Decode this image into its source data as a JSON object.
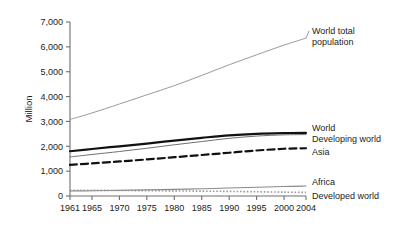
{
  "chart_data": {
    "type": "line",
    "title": "",
    "subtitle": "",
    "xlabel": "",
    "ylabel": "Million",
    "xlim": [
      1961,
      2004
    ],
    "ylim": [
      0,
      7000
    ],
    "grid": false,
    "legend_position": "right-inline-labels",
    "x_tick_labels": [
      "1961",
      "1965",
      "1970",
      "1975",
      "1980",
      "1985",
      "1990",
      "1995",
      "2000",
      "2004"
    ],
    "x_ticks": [
      1961,
      1965,
      1970,
      1975,
      1980,
      1985,
      1990,
      1995,
      2000,
      2004
    ],
    "y_tick_labels": [
      "0",
      "1,000",
      "2,000",
      "3,000",
      "4,000",
      "5,000",
      "6,000",
      "7,000"
    ],
    "y_ticks": [
      0,
      1000,
      2000,
      3000,
      4000,
      5000,
      6000,
      7000
    ],
    "x": [
      1961,
      1965,
      1970,
      1975,
      1980,
      1985,
      1990,
      1995,
      2000,
      2004
    ],
    "series": [
      {
        "name": "World total population",
        "label": "World total population",
        "label_lines": [
          "World total",
          "population"
        ],
        "style": "solid-thin",
        "color": "#9a9a9a",
        "width": 1.0,
        "values": [
          3080,
          3340,
          3700,
          4070,
          4440,
          4850,
          5280,
          5680,
          6070,
          6350
        ]
      },
      {
        "name": "World",
        "label": "World",
        "label_lines": [
          "World"
        ],
        "style": "solid-thick",
        "color": "#111111",
        "width": 2.2,
        "values": [
          1800,
          1890,
          2000,
          2110,
          2230,
          2340,
          2440,
          2500,
          2530,
          2540
        ]
      },
      {
        "name": "Developing world",
        "label": "Developing world",
        "label_lines": [
          "Developing world"
        ],
        "style": "solid-thin",
        "color": "#707070",
        "width": 1.0,
        "values": [
          1570,
          1670,
          1790,
          1920,
          2060,
          2190,
          2320,
          2410,
          2460,
          2470
        ]
      },
      {
        "name": "Asia",
        "label": "Asia",
        "label_lines": [
          "Asia"
        ],
        "style": "dashed",
        "color": "#111111",
        "width": 2.2,
        "values": [
          1250,
          1310,
          1390,
          1470,
          1560,
          1650,
          1740,
          1830,
          1900,
          1920
        ]
      },
      {
        "name": "Africa",
        "label": "Africa",
        "label_lines": [
          "Africa"
        ],
        "style": "solid-thin",
        "color": "#8a8a8a",
        "width": 1.1,
        "values": [
          205,
          210,
          225,
          245,
          265,
          290,
          320,
          350,
          385,
          400
        ]
      },
      {
        "name": "Developed world",
        "label": "Developed world",
        "label_lines": [
          "Developed world"
        ],
        "style": "dotted",
        "color": "#9a9a9a",
        "width": 1.6,
        "values": [
          230,
          228,
          222,
          215,
          205,
          195,
          185,
          170,
          155,
          145
        ]
      }
    ]
  }
}
